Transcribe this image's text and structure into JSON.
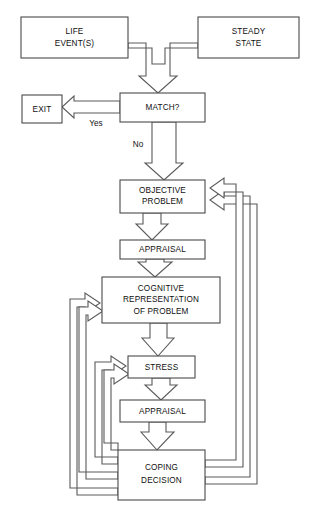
{
  "diagram": {
    "background_color": "#ffffff",
    "line_color": "#5a5a5a",
    "text_color": "#101010",
    "nodes": [
      {
        "id": "life_events",
        "label_line1": "LIFE",
        "label_line2": "EVENT(S)"
      },
      {
        "id": "steady_state",
        "label_line1": "STEADY",
        "label_line2": "STATE"
      },
      {
        "id": "match",
        "label_line1": "MATCH?",
        "label_line2": ""
      },
      {
        "id": "exit",
        "label_line1": "EXIT",
        "label_line2": ""
      },
      {
        "id": "objective_problem",
        "label_line1": "OBJECTIVE",
        "label_line2": "PROBLEM"
      },
      {
        "id": "appraisal_1",
        "label_line1": "APPRAISAL",
        "label_line2": ""
      },
      {
        "id": "cognitive_rep",
        "label_line1": "COGNITIVE",
        "label_line2": "REPRESENTATION",
        "label_line3": "OF PROBLEM"
      },
      {
        "id": "stress",
        "label_line1": "STRESS",
        "label_line2": ""
      },
      {
        "id": "appraisal_2",
        "label_line1": "APPRAISAL",
        "label_line2": ""
      },
      {
        "id": "coping_decision",
        "label_line1": "COPING",
        "label_line2": "DECISION"
      }
    ],
    "edge_labels": {
      "yes": "Yes",
      "no": "No"
    }
  }
}
